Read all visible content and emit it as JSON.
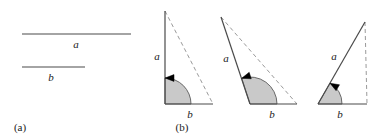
{
  "figure": {
    "width": 380,
    "height": 137,
    "background": "#ffffff",
    "stroke_color": "#4a4a4a",
    "dashed_color": "#9a9a9a",
    "arc_fill": "#c9c9c9",
    "arc_stroke": "#5a5a5a",
    "arrow_color": "#000000",
    "text_color": "#1a1a1a"
  },
  "panel_a": {
    "caption": "(a)",
    "caption_x": 10,
    "caption_y": 131,
    "segments": [
      {
        "name": "segment-a",
        "label": "a",
        "x1": 22,
        "y1": 34,
        "x2": 131,
        "y2": 34,
        "label_x": 76,
        "label_y": 48
      },
      {
        "name": "segment-b",
        "label": "b",
        "x1": 22,
        "y1": 67,
        "x2": 85,
        "y2": 67,
        "label_x": 51,
        "label_y": 81
      }
    ]
  },
  "panel_b": {
    "caption": "(b)",
    "caption_x": 172,
    "caption_y": 131,
    "triangles": [
      {
        "name": "triangle-right-angle",
        "angle_type": "right",
        "vertex": {
          "x": 165,
          "y": 104
        },
        "apex_a": {
          "x": 165,
          "y": 11
        },
        "end_b": {
          "x": 213,
          "y": 104
        },
        "label_a": "a",
        "label_a_x": 157,
        "label_a_y": 60,
        "label_b": "b",
        "label_b_x": 190,
        "label_b_y": 118,
        "arc_radius": 26,
        "arc_start_deg": 0,
        "arc_end_deg": 90,
        "arrow_at_deg": 90
      },
      {
        "name": "triangle-obtuse-angle",
        "angle_type": "obtuse",
        "vertex": {
          "x": 250,
          "y": 104
        },
        "apex_a": {
          "x": 221,
          "y": 17
        },
        "end_b": {
          "x": 297,
          "y": 104
        },
        "label_a": "a",
        "label_a_x": 226,
        "label_a_y": 62,
        "label_b": "b",
        "label_b_x": 272,
        "label_b_y": 118,
        "arc_radius": 27,
        "arc_start_deg": 0,
        "arc_end_deg": 108,
        "arrow_at_deg": 108
      },
      {
        "name": "triangle-acute-angle",
        "angle_type": "acute",
        "vertex": {
          "x": 318,
          "y": 104
        },
        "apex_a": {
          "x": 365,
          "y": 22
        },
        "end_b": {
          "x": 367,
          "y": 104
        },
        "label_a": "a",
        "label_a_x": 334,
        "label_a_y": 60,
        "label_b": "b",
        "label_b_x": 340,
        "label_b_y": 118,
        "arc_radius": 24,
        "arc_start_deg": 0,
        "arc_end_deg": 60,
        "arrow_at_deg": 60
      }
    ]
  }
}
